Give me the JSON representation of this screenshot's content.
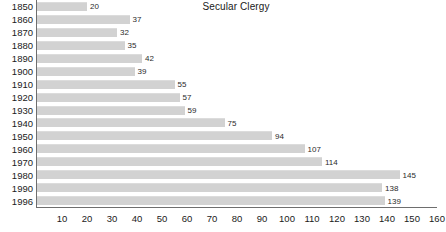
{
  "chart_data": {
    "type": "bar",
    "orientation": "horizontal",
    "title": "Secular Clergy",
    "xlabel": "",
    "ylabel": "",
    "xlim": [
      0,
      160
    ],
    "xticks": [
      10,
      20,
      30,
      40,
      50,
      60,
      70,
      80,
      90,
      100,
      110,
      120,
      130,
      140,
      150,
      160
    ],
    "grid": false,
    "legend": null,
    "bar_color": "#d2d2d2",
    "axis_color": "#6e6e6e",
    "text_color": "#1a1a1a",
    "categories": [
      "1850",
      "1860",
      "1870",
      "1880",
      "1890",
      "1900",
      "1910",
      "1920",
      "1930",
      "1940",
      "1950",
      "1960",
      "1970",
      "1980",
      "1990",
      "1996"
    ],
    "values": [
      20,
      37,
      32,
      35,
      42,
      39,
      55,
      57,
      59,
      75,
      94,
      107,
      114,
      145,
      138,
      139
    ],
    "data_labels": [
      "20",
      "37",
      "32",
      "35",
      "42",
      "39",
      "55",
      "57",
      "59",
      "75",
      "94",
      "107",
      "114",
      "145",
      "138",
      "139"
    ]
  }
}
